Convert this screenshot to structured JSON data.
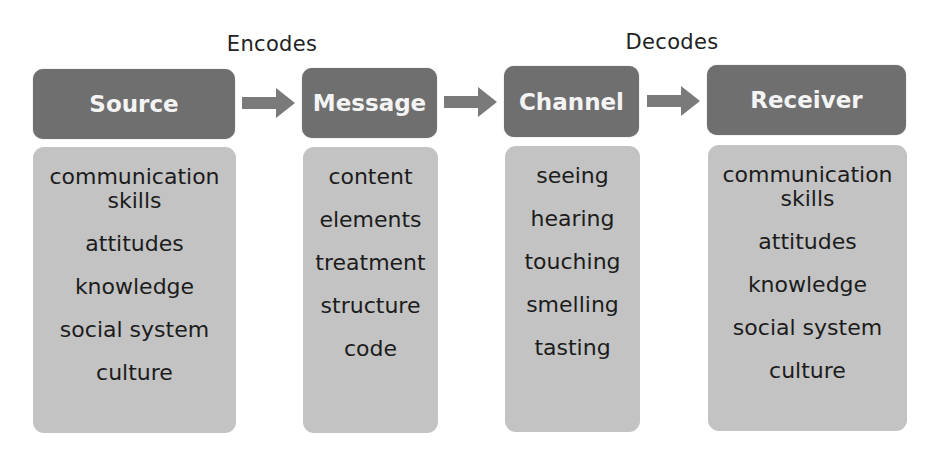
{
  "diagram": {
    "title_type": "SMCR communication model",
    "annotations": {
      "encodes": "Encodes",
      "decodes": "Decodes"
    },
    "colors": {
      "header_bg": "#6f6f6f",
      "header_text": "#f4f4f4",
      "body_bg": "#c3c3c3",
      "body_text": "#1c1c1c",
      "arrow": "#7a7a7a"
    },
    "stages": [
      {
        "title": "Source",
        "items": [
          "communication skills",
          "attitudes",
          "knowledge",
          "social system",
          "culture"
        ]
      },
      {
        "title": "Message",
        "items": [
          "content",
          "elements",
          "treatment",
          "structure",
          "code"
        ]
      },
      {
        "title": "Channel",
        "items": [
          "seeing",
          "hearing",
          "touching",
          "smelling",
          "tasting"
        ]
      },
      {
        "title": "Receiver",
        "items": [
          "communication skills",
          "attitudes",
          "knowledge",
          "social system",
          "culture"
        ]
      }
    ]
  }
}
